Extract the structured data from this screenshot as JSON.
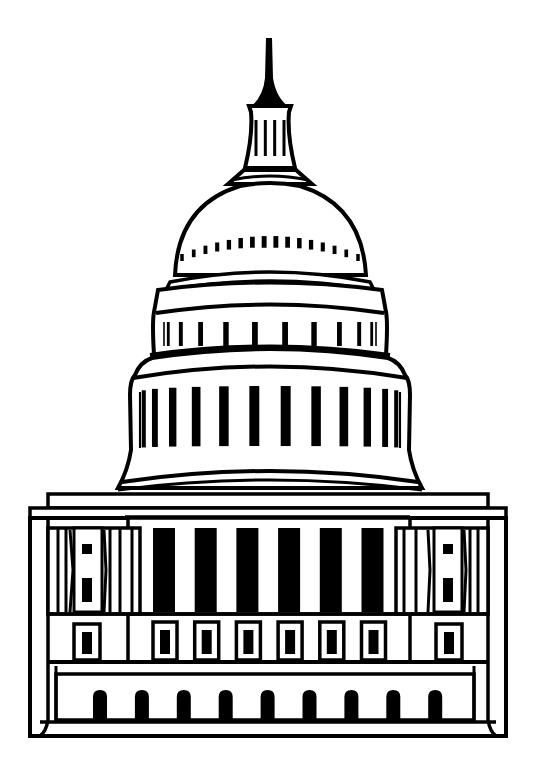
{
  "illustration": {
    "subject": "United States Capitol building line art",
    "stroke_color": "#000000",
    "fill_color": "#ffffff",
    "background": "#ffffff"
  },
  "counts": {
    "lantern_columns": 4,
    "dome_windows": 16,
    "upper_drum_columns": 12,
    "lower_drum_columns": 14,
    "portico_columns": 6,
    "portico_windows": 6,
    "wing_windows_per_side": 1,
    "ground_arches": 9
  }
}
